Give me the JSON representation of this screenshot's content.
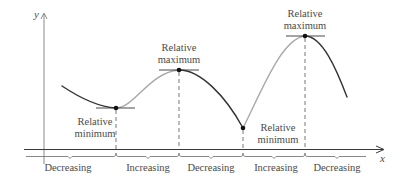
{
  "axes": {
    "x_label": "x",
    "y_label": "y"
  },
  "colors": {
    "decreasing": "#333333",
    "increasing": "#a8a8a8",
    "axis": "#3a3a3a",
    "text": "#4a4a4a"
  },
  "extrema": [
    {
      "type": "min",
      "line1": "Relative",
      "line2": "minimum"
    },
    {
      "type": "max",
      "line1": "Relative",
      "line2": "maximum"
    },
    {
      "type": "min",
      "line1": "Relative",
      "line2": "minimum"
    },
    {
      "type": "max",
      "line1": "Relative",
      "line2": "maximum"
    }
  ],
  "intervals": [
    {
      "label": "Decreasing"
    },
    {
      "label": "Increasing"
    },
    {
      "label": "Decreasing"
    },
    {
      "label": "Increasing"
    },
    {
      "label": "Decreasing"
    }
  ]
}
